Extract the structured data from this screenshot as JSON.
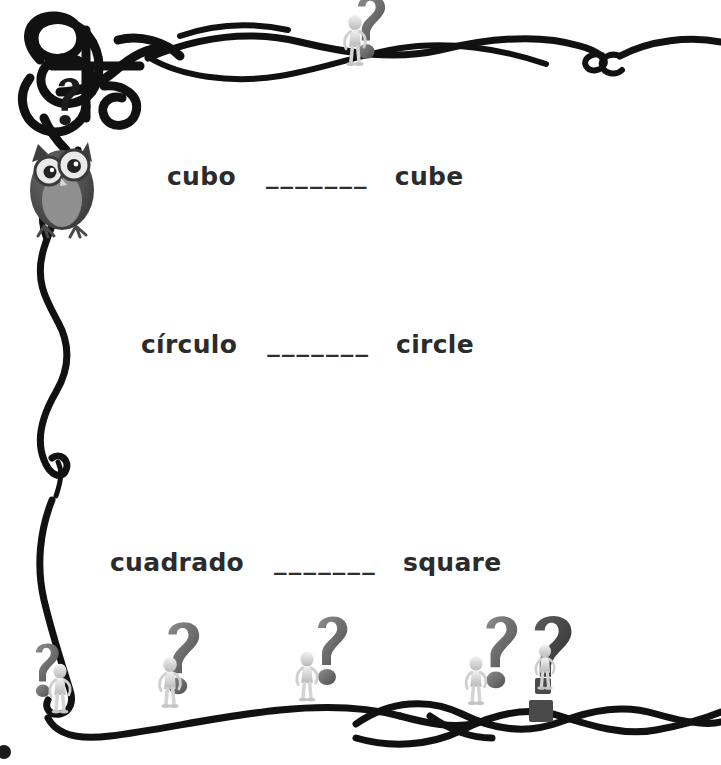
{
  "worksheet": {
    "title": "Spanish-English shape vocabulary matching worksheet",
    "background_color": "#ffffff",
    "text_color": "#2b2b2b",
    "line_color": "#111111",
    "rows": [
      {
        "spanish": "cubo",
        "blank": "_______",
        "english": "cube"
      },
      {
        "spanish": "círculo",
        "blank": "_______",
        "english": "circle"
      },
      {
        "spanish": "cuadrado",
        "blank": "_______",
        "english": "square"
      }
    ]
  },
  "decorations": {
    "top_left_knot": "celtic-knot-tangle",
    "owl": "owl-illustration",
    "question_marks": [
      "question-mark-top-left",
      "question-mark-top-center",
      "question-mark-bottom-1",
      "question-mark-bottom-2",
      "question-mark-bottom-3",
      "question-mark-bottom-4",
      "question-mark-bottom-5"
    ],
    "figures": [
      "figure-top-center",
      "figure-bottom-1",
      "figure-bottom-2",
      "figure-bottom-3",
      "figure-bottom-4",
      "figure-bottom-5"
    ],
    "borders": [
      "top-wave-border",
      "left-swirl-border",
      "bottom-wave-border",
      "bottom-braid-border"
    ]
  }
}
